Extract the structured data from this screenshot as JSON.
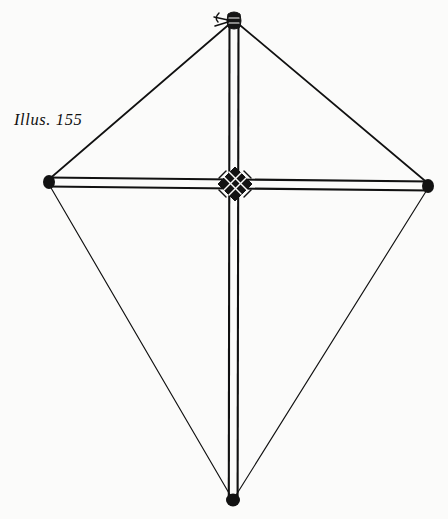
{
  "figure": {
    "caption": "Illus. 155",
    "background_color": "#fbfbfa",
    "ink_color": "#111111",
    "canvas": {
      "width": 448,
      "height": 519
    }
  },
  "geometry": {
    "vertices": {
      "top": {
        "x": 234,
        "y": 20
      },
      "left": {
        "x": 47,
        "y": 181
      },
      "right": {
        "x": 430,
        "y": 185
      },
      "bottom": {
        "x": 233,
        "y": 500
      },
      "center": {
        "x": 235,
        "y": 183
      }
    },
    "spine": {
      "label": "vertical-spine",
      "from": "top",
      "to": "bottom",
      "rendered_as": "double-line-dowel",
      "width_px": 9
    },
    "spar": {
      "label": "horizontal-cross-spar",
      "from": "left",
      "to": "right",
      "rendered_as": "double-line-dowel",
      "width_px": 9
    },
    "outline_edges": [
      {
        "name": "upper-left-edge",
        "from": "left",
        "to": "top",
        "stroke_px": 1.6
      },
      {
        "name": "upper-right-edge",
        "from": "top",
        "to": "right",
        "stroke_px": 1.6
      },
      {
        "name": "lower-left-edge",
        "from": "left",
        "to": "bottom",
        "stroke_px": 1.1
      },
      {
        "name": "lower-right-edge",
        "from": "right",
        "to": "bottom",
        "stroke_px": 1.1
      }
    ],
    "fittings": [
      {
        "name": "top-lashing-knot",
        "x": 234,
        "y": 20,
        "type": "knot-with-bridle-loop"
      },
      {
        "name": "left-tip-knob",
        "x": 47,
        "y": 181,
        "type": "knob"
      },
      {
        "name": "right-tip-knob",
        "x": 430,
        "y": 185,
        "type": "knob"
      },
      {
        "name": "bottom-tip-knob",
        "x": 233,
        "y": 500,
        "type": "knob"
      },
      {
        "name": "center-cross-lashing",
        "x": 235,
        "y": 183,
        "type": "diagonal-wrap-binding"
      }
    ]
  }
}
